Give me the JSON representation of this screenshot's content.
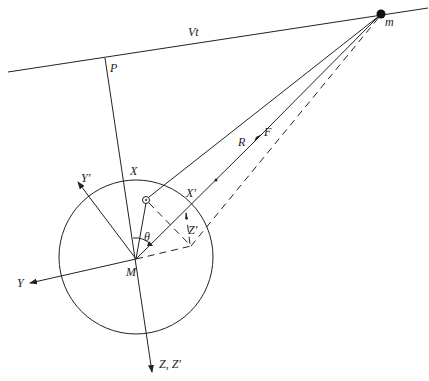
{
  "diagram": {
    "title": "",
    "labels": {
      "velocity_line": "Vt",
      "mass": "m",
      "closest_point": "P",
      "force": "F",
      "distance": "R",
      "x_axis": "X",
      "x_prime_axis": "X'",
      "y_axis": "Y",
      "y_prime_axis": "Y'",
      "z_axes": "Z, Z'",
      "z_prime_component": "Z'",
      "angle": "θ",
      "center": "M"
    },
    "nodes": [
      {
        "id": "m",
        "label": "m",
        "x": 381,
        "y": 14,
        "type": "filled-dot"
      },
      {
        "id": "P",
        "label": "P",
        "x": 105,
        "y": 57,
        "type": "point"
      },
      {
        "id": "M",
        "label": "M",
        "x": 136,
        "y": 259,
        "type": "center"
      },
      {
        "id": "small-circle",
        "label": "",
        "x": 146,
        "y": 200,
        "type": "small-circle"
      },
      {
        "id": "Zp",
        "label": "",
        "x": 191,
        "y": 246,
        "type": "point"
      }
    ],
    "edges": [
      {
        "from": "line-start",
        "to": "line-end",
        "label": "Vt",
        "style": "solid"
      },
      {
        "from": "P",
        "to": "Z-arrow",
        "label": "X",
        "style": "solid"
      },
      {
        "from": "small-circle",
        "to": "m",
        "label": "F",
        "style": "solid"
      },
      {
        "from": "M",
        "to": "m",
        "label": "R",
        "style": "solid-arrow"
      },
      {
        "from": "Zp",
        "to": "m",
        "label": "",
        "style": "dashed"
      },
      {
        "from": "M",
        "to": "Zp",
        "label": "",
        "style": "dashed"
      },
      {
        "from": "small-circle",
        "to": "Zp",
        "label": "",
        "style": "dashed"
      },
      {
        "from": "M",
        "to": "Y'",
        "label": "Y'",
        "style": "arrow"
      },
      {
        "from": "M",
        "to": "Y",
        "label": "Y",
        "style": "arrow"
      }
    ],
    "circle": {
      "cx": 136,
      "cy": 257,
      "r": 77
    }
  }
}
